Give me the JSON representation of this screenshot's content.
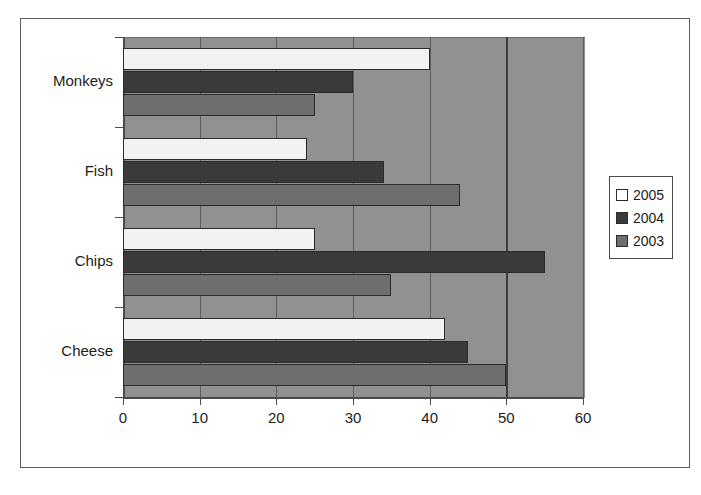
{
  "chart_data": {
    "type": "bar",
    "orientation": "horizontal",
    "title": "",
    "subtitle": "",
    "xlabel": "",
    "ylabel": "",
    "categories": [
      "Cheese",
      "Chips",
      "Fish",
      "Monkeys"
    ],
    "categories_top_to_bottom": [
      "Monkeys",
      "Fish",
      "Chips",
      "Cheese"
    ],
    "series": [
      {
        "name": "2005",
        "color": "#ffffff",
        "values": [
          42,
          25,
          24,
          40
        ]
      },
      {
        "name": "2004",
        "color": "#3a3a3a",
        "values": [
          45,
          55,
          34,
          30
        ]
      },
      {
        "name": "2003",
        "color": "#6e6e6e",
        "values": [
          50,
          35,
          44,
          25
        ]
      }
    ],
    "xlim": [
      0,
      60
    ],
    "xticks": [
      0,
      10,
      20,
      30,
      40,
      50,
      60
    ],
    "xtick_labels": [
      "0",
      "10",
      "20",
      "30",
      "40",
      "50",
      "60"
    ],
    "grid": true,
    "grid_axis": "x",
    "legend_position": "right",
    "plot_background": "#919191",
    "figure_background": "#ffffff",
    "axis_color": "#4a4a4a",
    "series_order_within_group_top_to_bottom": [
      "2005",
      "2004",
      "2003"
    ]
  },
  "legend": {
    "entries": [
      {
        "label": "2005",
        "swatch": "s2005"
      },
      {
        "label": "2004",
        "swatch": "s2004"
      },
      {
        "label": "2003",
        "swatch": "s2003"
      }
    ]
  }
}
